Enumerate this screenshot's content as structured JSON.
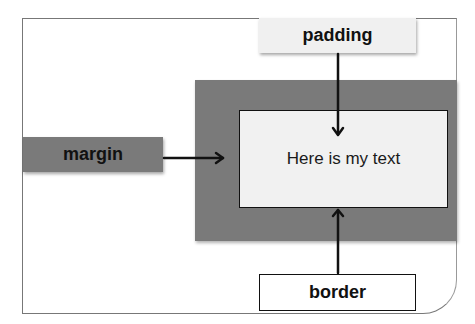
{
  "diagram": {
    "labels": {
      "padding": "padding",
      "margin": "margin",
      "border": "border",
      "content": "Here is my text"
    },
    "colors": {
      "margin_fill": "#7a7a7a",
      "padding_label_fill": "#f0f0f0",
      "content_fill": "#f1f1f1",
      "border_label_fill": "#ffffff",
      "arrow": "#111111"
    },
    "arrows": [
      {
        "from": "padding",
        "to": "content",
        "direction": "down"
      },
      {
        "from": "margin",
        "to": "margin-area",
        "direction": "right"
      },
      {
        "from": "border",
        "to": "content-border",
        "direction": "up"
      }
    ]
  }
}
